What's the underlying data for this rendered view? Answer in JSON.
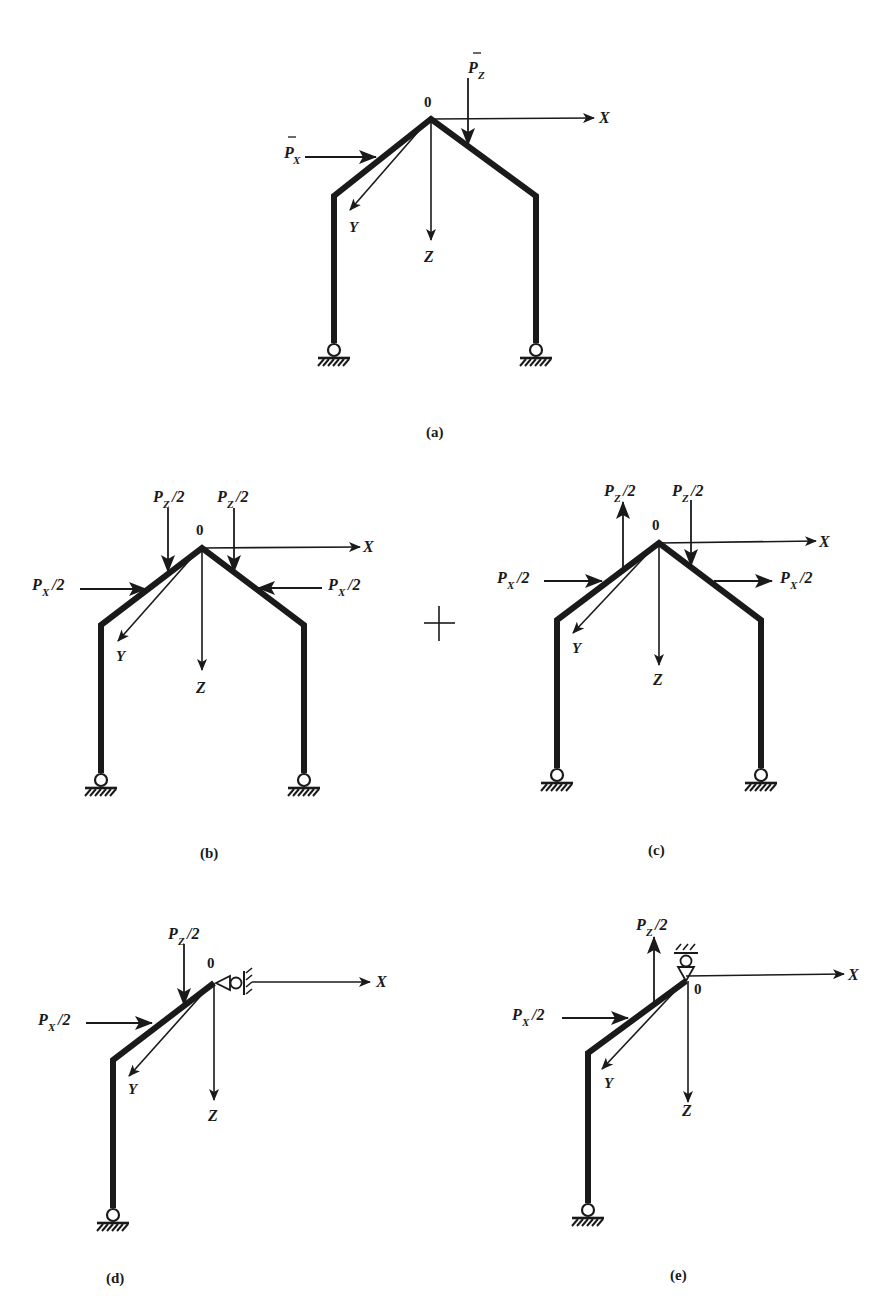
{
  "figure": {
    "origin_label": "0",
    "axes": {
      "x": "X",
      "y": "Y",
      "z": "Z"
    },
    "plus_sign": "+",
    "panels": [
      {
        "id": "a",
        "caption": "(a)",
        "loads": [
          {
            "symbol": "P",
            "subscript": "X",
            "bar": true,
            "direction": "right",
            "location": "left rafter"
          },
          {
            "symbol": "P",
            "subscript": "Z",
            "bar": true,
            "direction": "down",
            "location": "right rafter near apex"
          }
        ],
        "supports": [
          "pin-left",
          "pin-right"
        ]
      },
      {
        "id": "b",
        "caption": "(b)",
        "case": "symmetric",
        "loads": [
          {
            "symbol": "P",
            "subscript": "Z",
            "suffix": "/2",
            "direction": "down",
            "location": "left rafter"
          },
          {
            "symbol": "P",
            "subscript": "Z",
            "suffix": "/2",
            "direction": "down",
            "location": "right rafter"
          },
          {
            "symbol": "P",
            "subscript": "X",
            "suffix": "/2",
            "direction": "right",
            "location": "left rafter"
          },
          {
            "symbol": "P",
            "subscript": "X",
            "suffix": "/2",
            "direction": "left",
            "location": "right rafter"
          }
        ],
        "supports": [
          "pin-left",
          "pin-right"
        ]
      },
      {
        "id": "c",
        "caption": "(c)",
        "case": "antisymmetric",
        "loads": [
          {
            "symbol": "P",
            "subscript": "Z",
            "suffix": "/2",
            "direction": "up",
            "location": "left rafter"
          },
          {
            "symbol": "P",
            "subscript": "Z",
            "suffix": "/2",
            "direction": "down",
            "location": "right rafter"
          },
          {
            "symbol": "P",
            "subscript": "X",
            "suffix": "/2",
            "direction": "right",
            "location": "left rafter"
          },
          {
            "symbol": "P",
            "subscript": "X",
            "suffix": "/2",
            "direction": "right",
            "location": "right rafter"
          }
        ],
        "supports": [
          "pin-left",
          "pin-right"
        ]
      },
      {
        "id": "d",
        "caption": "(d)",
        "case": "symmetric half-frame",
        "loads": [
          {
            "symbol": "P",
            "subscript": "Z",
            "suffix": "/2",
            "direction": "down"
          },
          {
            "symbol": "P",
            "subscript": "X",
            "suffix": "/2",
            "direction": "right"
          }
        ],
        "supports": [
          "pin-base",
          "horizontal-roller-at-apex"
        ]
      },
      {
        "id": "e",
        "caption": "(e)",
        "case": "antisymmetric half-frame",
        "loads": [
          {
            "symbol": "P",
            "subscript": "Z",
            "suffix": "/2",
            "direction": "up"
          },
          {
            "symbol": "P",
            "subscript": "X",
            "suffix": "/2",
            "direction": "right"
          }
        ],
        "supports": [
          "pin-base",
          "vertical-roller-at-apex"
        ]
      }
    ]
  },
  "labels": {
    "P": "P",
    "X": "X",
    "Z": "Z",
    "half": "/2",
    "zero": "0"
  }
}
